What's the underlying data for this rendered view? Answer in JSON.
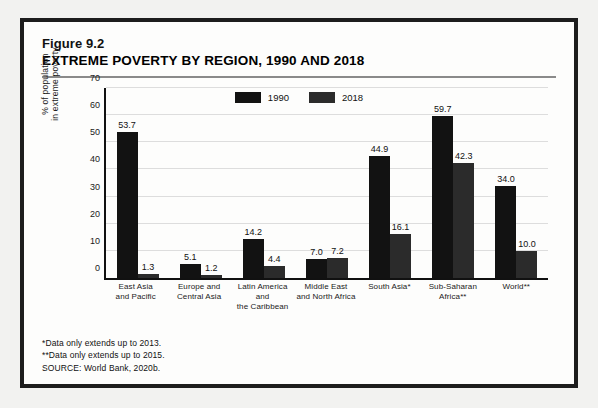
{
  "figure": {
    "number": "Figure 9.2",
    "title": "EXTREME POVERTY BY REGION, 1990 AND 2018"
  },
  "notes": {
    "note1": "*Data only extends up to 2013.",
    "note2": "**Data only extends up to 2015.",
    "source": "SOURCE: World Bank, 2020b."
  },
  "colors": {
    "series_1990": "#121212",
    "series_2018": "#2b2b2b",
    "border": "#1d1d1d",
    "gridline": "#dddddd",
    "page_background": "#f2f2f0",
    "figure_background": "#fdfdfc"
  },
  "chart_data": {
    "type": "bar",
    "title": "EXTREME POVERTY BY REGION, 1990 AND 2018",
    "xlabel": "",
    "ylabel": "% of population\nin extreme poverty",
    "ylim": [
      0,
      70
    ],
    "yticks": [
      0,
      10,
      20,
      30,
      40,
      50,
      60,
      70
    ],
    "ytick_labels": [
      "0",
      "10",
      "20",
      "30",
      "40",
      "50",
      "60",
      "70"
    ],
    "grid": true,
    "legend_position": "top-center",
    "categories": [
      "East Asia\nand Pacific",
      "Europe and\nCentral Asia",
      "Latin America and\nthe Caribbean",
      "Middle East\nand North Africa",
      "South Asia*",
      "Sub-Saharan\nAfrica**",
      "World**"
    ],
    "series": [
      {
        "name": "1990",
        "values": [
          53.7,
          5.1,
          14.2,
          7.0,
          44.9,
          59.7,
          34.0
        ],
        "labels": [
          "53.7",
          "5.1",
          "14.2",
          "7.0",
          "44.9",
          "59.7",
          "34.0"
        ]
      },
      {
        "name": "2018",
        "values": [
          1.3,
          1.2,
          4.4,
          7.2,
          16.1,
          42.3,
          10.0
        ],
        "labels": [
          "1.3",
          "1.2",
          "4.4",
          "7.2",
          "16.1",
          "42.3",
          "10.0"
        ]
      }
    ]
  }
}
